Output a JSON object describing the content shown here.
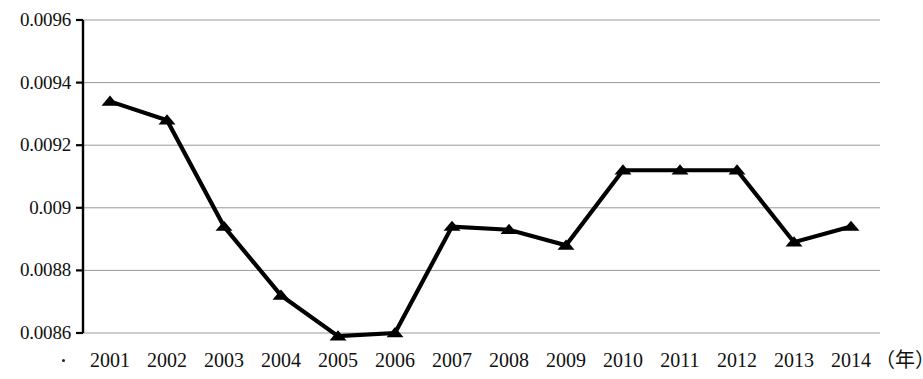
{
  "chart_data": {
    "type": "line",
    "title": "",
    "subtitle": "",
    "xlabel": "（年）",
    "ylabel": "",
    "categories": [
      "2001",
      "2002",
      "2003",
      "2004",
      "2005",
      "2006",
      "2007",
      "2008",
      "2009",
      "2010",
      "2011",
      "2012",
      "2013",
      "2014"
    ],
    "values": [
      0.00934,
      0.00928,
      0.00894,
      0.00872,
      0.00859,
      0.0086,
      0.00894,
      0.00893,
      0.00888,
      0.00912,
      0.00912,
      0.00912,
      0.00889,
      0.00894
    ],
    "series": [
      {
        "name": "",
        "values": [
          0.00934,
          0.00928,
          0.00894,
          0.00872,
          0.00859,
          0.0086,
          0.00894,
          0.00893,
          0.00888,
          0.00912,
          0.00912,
          0.00912,
          0.00889,
          0.00894
        ]
      }
    ],
    "ylim": [
      0.0086,
      0.0096
    ],
    "xlim": [
      "2001",
      "2014"
    ],
    "ytick_labels": [
      "0.0096",
      "0.0094",
      "0.0092",
      "0.009",
      "0.0088",
      "0.0086"
    ],
    "ytick_values": [
      0.0096,
      0.0094,
      0.0092,
      0.009,
      0.0088,
      0.0086
    ],
    "grid": true,
    "grid_axis": "y",
    "legend": false,
    "legend_position": "none",
    "marker": "triangle",
    "marker_color": "#000000",
    "line_color": "#000000",
    "grid_color": "#999999",
    "axis_color": "#000000"
  },
  "axis": {
    "x_unit_label": "（年）"
  }
}
